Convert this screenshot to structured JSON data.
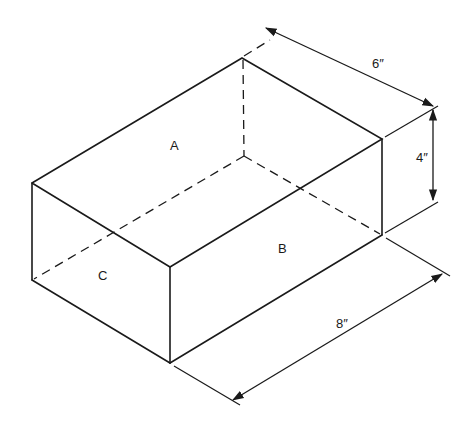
{
  "diagram": {
    "type": "isometric rectangular box with dimensions",
    "faces": {
      "top": "A",
      "right_front": "B",
      "left_end": "C"
    },
    "dimensions": {
      "width": "6″",
      "height": "4″",
      "length": "8″"
    }
  }
}
